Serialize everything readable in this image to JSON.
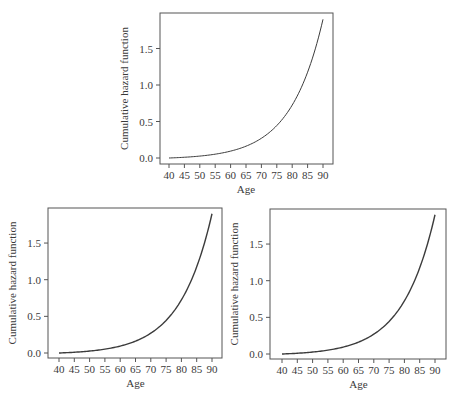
{
  "figure": {
    "panels_count": 3,
    "colors": {
      "frame": "#555555",
      "curve": "#3c3c3c",
      "text": "#3a3a3a",
      "background": "#ffffff"
    }
  },
  "chart_data": [
    {
      "type": "line",
      "panel": "top",
      "title": "",
      "xlabel": "Age",
      "ylabel": "Cumulative hazard function",
      "xlim": [
        40,
        90
      ],
      "ylim": [
        0,
        1.9
      ],
      "xticks": [
        40,
        45,
        50,
        55,
        60,
        65,
        70,
        75,
        80,
        85,
        90
      ],
      "xtick_labels": [
        "40",
        "45",
        "50",
        "55",
        "60",
        "65",
        "70",
        "75",
        "80",
        "85",
        "90"
      ],
      "yticks": [
        0.0,
        0.5,
        1.0,
        1.5
      ],
      "ytick_labels": [
        "0.0",
        "0.5",
        "1.0",
        "1.5"
      ],
      "grid": false,
      "legend": null,
      "series": [
        {
          "name": "cumulative hazard",
          "x": [
            40,
            45,
            50,
            55,
            60,
            65,
            70,
            75,
            80,
            85,
            90
          ],
          "y": [
            0.0,
            0.01,
            0.03,
            0.05,
            0.09,
            0.16,
            0.27,
            0.44,
            0.72,
            1.18,
            1.9
          ]
        }
      ]
    },
    {
      "type": "line",
      "panel": "bottom-left",
      "title": "",
      "xlabel": "Age",
      "ylabel": "Cumulative hazard function",
      "xlim": [
        40,
        90
      ],
      "ylim": [
        0,
        1.9
      ],
      "xticks": [
        40,
        45,
        50,
        55,
        60,
        65,
        70,
        75,
        80,
        85,
        90
      ],
      "xtick_labels": [
        "40",
        "45",
        "50",
        "55",
        "60",
        "65",
        "70",
        "75",
        "80",
        "85",
        "90"
      ],
      "yticks": [
        0.0,
        0.5,
        1.0,
        1.5
      ],
      "ytick_labels": [
        "0.0",
        "0.5",
        "1.0",
        "1.5"
      ],
      "grid": false,
      "legend": null,
      "series": [
        {
          "name": "cumulative hazard",
          "x": [
            40,
            45,
            50,
            55,
            60,
            65,
            70,
            75,
            80,
            85,
            90
          ],
          "y": [
            0.0,
            0.01,
            0.03,
            0.05,
            0.09,
            0.16,
            0.27,
            0.45,
            0.74,
            1.2,
            1.9
          ]
        }
      ]
    },
    {
      "type": "line",
      "panel": "bottom-right",
      "title": "",
      "xlabel": "Age",
      "ylabel": "Cumulative hazard function",
      "xlim": [
        40,
        90
      ],
      "ylim": [
        0,
        1.9
      ],
      "xticks": [
        40,
        45,
        50,
        55,
        60,
        65,
        70,
        75,
        80,
        85,
        90
      ],
      "xtick_labels": [
        "40",
        "45",
        "50",
        "55",
        "60",
        "65",
        "70",
        "75",
        "80",
        "85",
        "90"
      ],
      "yticks": [
        0.0,
        0.5,
        1.0,
        1.5
      ],
      "ytick_labels": [
        "0.0",
        "0.5",
        "1.0",
        "1.5"
      ],
      "grid": false,
      "legend": null,
      "series": [
        {
          "name": "cumulative hazard",
          "x": [
            40,
            45,
            50,
            55,
            60,
            65,
            70,
            75,
            80,
            85,
            90
          ],
          "y": [
            0.0,
            0.01,
            0.03,
            0.05,
            0.09,
            0.16,
            0.27,
            0.45,
            0.74,
            1.2,
            1.9
          ]
        }
      ]
    }
  ]
}
